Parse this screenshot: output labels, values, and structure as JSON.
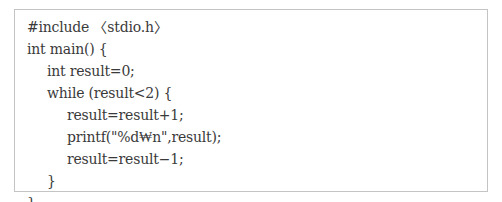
{
  "code_block": {
    "language": "C",
    "lines": [
      {
        "indent": 0,
        "text": "#include 〈stdio.h〉"
      },
      {
        "indent": 0,
        "text": "int main() {"
      },
      {
        "indent": 1,
        "text": "int result=0;"
      },
      {
        "indent": 1,
        "text": "while (result<2) {"
      },
      {
        "indent": 2,
        "text": "result=result+1;"
      },
      {
        "indent": 2,
        "text": "printf(\"%d₩n\",result);"
      },
      {
        "indent": 2,
        "text": "result=result−1;"
      },
      {
        "indent": 1,
        "text": "}"
      },
      {
        "indent": 0,
        "text": "}"
      }
    ]
  },
  "colors": {
    "border": "#c4c4c4",
    "text": "#3a3a3a",
    "background": "#ffffff"
  }
}
